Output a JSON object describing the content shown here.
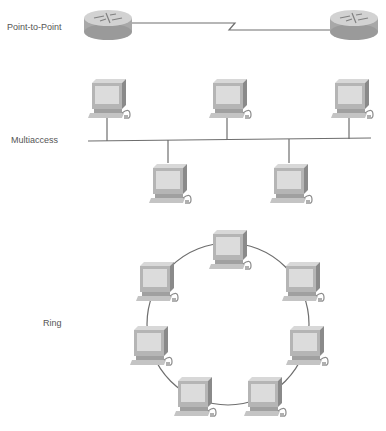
{
  "labels": {
    "point_to_point": "Point-to-Point",
    "multiaccess": "Multiaccess",
    "ring": "Ring"
  },
  "colors": {
    "link": "#6e6e6e",
    "device_body": "#c8c8c8",
    "device_shade": "#9a9a9a",
    "screen": "#dcdcdc",
    "label": "#555555"
  },
  "point_to_point": {
    "devices": [
      {
        "type": "router",
        "name": "router-left"
      },
      {
        "type": "router",
        "name": "router-right"
      }
    ],
    "link": "serial"
  },
  "multiaccess": {
    "devices_above_bus": 3,
    "devices_below_bus": 2
  },
  "ring": {
    "devices": 8
  }
}
